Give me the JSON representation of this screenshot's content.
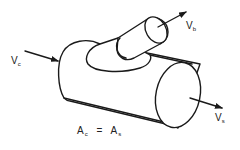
{
  "diagram": {
    "labels": {
      "inlet_velocity": {
        "main": "V",
        "sub": "c"
      },
      "branch_velocity": {
        "main": "V",
        "sub": "b"
      },
      "outlet_velocity": {
        "main": "V",
        "sub": "s"
      },
      "area_equation": {
        "lhs_main": "A",
        "lhs_sub": "c",
        "equals": "=",
        "rhs_main": "A",
        "rhs_sub": "s"
      }
    },
    "components": [
      "main-pipe",
      "branch-pipe",
      "inlet-arrow",
      "branch-arrow",
      "outlet-arrow"
    ],
    "colors": {
      "line": "#1a1a1a",
      "background": "#ffffff"
    }
  }
}
